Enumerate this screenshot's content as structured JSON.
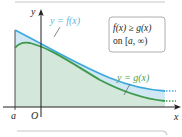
{
  "figure": {
    "axis_labels": {
      "x": "x",
      "y": "y"
    },
    "point_labels": {
      "a": "a",
      "origin": "O"
    },
    "curves": [
      {
        "name": "f",
        "label": "y = f(x)",
        "color": "#3fa9dd",
        "fill": "#cfe8f3"
      },
      {
        "name": "g",
        "label": "y = g(x)",
        "color": "#3d9a4a",
        "fill": "#d3e7da"
      }
    ],
    "annotation": {
      "line1": "f(x) ≥ g(x)",
      "line2_prefix": "on [",
      "line2_italic": "a",
      "line2_suffix": ", ∞)"
    },
    "colors": {
      "axis": "#231f20",
      "frame": "#bcbcbc",
      "box_border": "#9a9a9a",
      "label_blue": "#5fb3e0",
      "label_green": "#4ba052"
    }
  }
}
